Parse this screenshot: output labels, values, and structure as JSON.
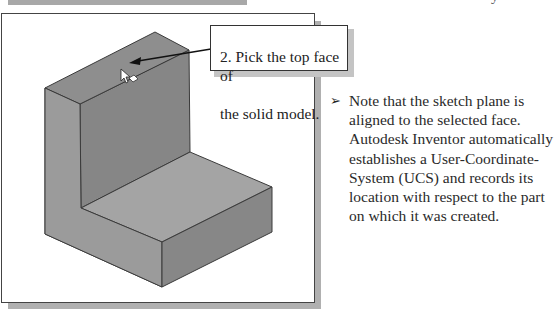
{
  "header": {
    "bar_color": "#a8a8a8",
    "partial_glyph": "y"
  },
  "figure": {
    "callout": {
      "lines": [
        "2. Pick the top face of",
        "the solid model."
      ]
    },
    "model": {
      "name": "L-shaped solid block",
      "colors": {
        "top_face": "#8f8f8f",
        "left_face": "#9c9c9c",
        "inner_wall": "#858585",
        "step_top": "#a3a3a3",
        "step_front": "#9a9a9a",
        "step_right": "#888888",
        "edge": "#3a3a3a"
      }
    },
    "cursor": "select-face-cursor"
  },
  "note": {
    "bullet_icon": "➢",
    "lines": [
      "Note that the sketch plane is",
      "aligned to the selected face.",
      "Autodesk Inventor automatically",
      "establishes a User-Coordinate-",
      "System (UCS) and records its",
      "location with respect to the part",
      "on which it was created."
    ]
  }
}
